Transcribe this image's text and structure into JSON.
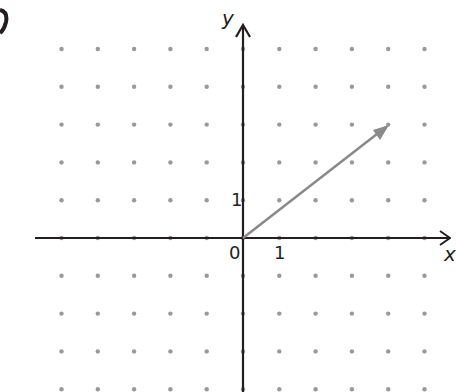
{
  "figure": {
    "part_label": "b",
    "axis_labels": {
      "x": "x",
      "y": "y"
    },
    "tick_labels": {
      "origin": "0",
      "x_one": "1",
      "y_one": "1"
    },
    "grid": {
      "type": "dot",
      "x_range": [
        -5,
        5
      ],
      "y_range": [
        -4,
        5
      ],
      "dot_color": "#9a9a9a"
    },
    "vector": {
      "from": [
        0,
        0
      ],
      "to": [
        4,
        3
      ],
      "color": "#8a8a8a"
    },
    "axis_color": "#231f20"
  }
}
